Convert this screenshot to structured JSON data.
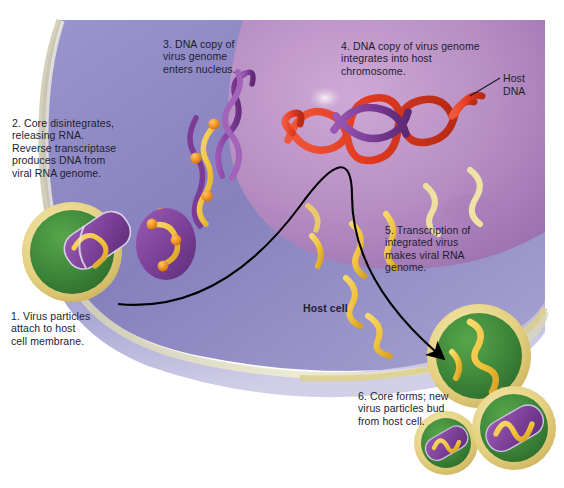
{
  "figure": {
    "title_alt": "Retrovirus replication cycle in a host cell",
    "steps": [
      {
        "id": "step-1",
        "number": "1.",
        "text": "Virus particles\nattach to host\ncell membrane."
      },
      {
        "id": "step-2",
        "number": "2.",
        "text": "Core disintegrates,\nreleasing RNA.\nReverse transcriptase\nproduces DNA from\nviral RNA genome."
      },
      {
        "id": "step-3",
        "number": "3.",
        "text": "DNA copy of\nvirus genome\nenters nucleus."
      },
      {
        "id": "step-4",
        "number": "4.",
        "text": "DNA copy of virus genome\nintegrates into host\nchromosome."
      },
      {
        "id": "step-5",
        "number": "5.",
        "text": "Transcription of\nintegrated virus\nmakes viral RNA\ngenome."
      },
      {
        "id": "step-6",
        "number": "6.",
        "text": "Core forms; new\nvirus particles bud\nfrom host cell."
      }
    ],
    "labels": {
      "host_dna": "Host\nDNA",
      "host_cell": "Host cell"
    },
    "colors": {
      "background": "#ffffff",
      "cytoplasm": "#8a85bf",
      "cytoplasm_light": "#b9b6d8",
      "nucleus": "#b68ec2",
      "nucleus_light": "#cfa9d6",
      "membrane_rim": "#e2dfc0",
      "virus_envelope": "#3f8a3a",
      "virus_halo": "#e8d98a",
      "virus_core": "#7a3f96",
      "rna_yellow": "#f2c53d",
      "enzyme_orange": "#f09221",
      "host_dna_red": "#e0391f",
      "viral_dna_purple": "#7b3b96",
      "arrow": "#000000",
      "text": "#221c33"
    }
  }
}
